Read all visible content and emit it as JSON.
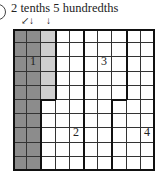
{
  "header": {
    "title": "2 tenths 5 hundredths",
    "arrows": [
      "↙",
      "↓",
      "↓"
    ]
  },
  "grid": {
    "rows": 10,
    "cols": 10,
    "colors": {
      "tenths_fill": "#8c8c8c",
      "hundredths_fill": "#cfcfcf",
      "empty_fill": "#ffffff",
      "line": "#333333",
      "thick_line": "#111111"
    },
    "shaded": {
      "tenths_columns": [
        0,
        1
      ],
      "hundredths_cells": [
        [
          0,
          2
        ],
        [
          1,
          2
        ],
        [
          2,
          2
        ],
        [
          3,
          2
        ],
        [
          4,
          2
        ]
      ]
    },
    "regions": [
      {
        "label": "1"
      },
      {
        "label": "2"
      },
      {
        "label": "3"
      },
      {
        "label": "4"
      }
    ]
  }
}
